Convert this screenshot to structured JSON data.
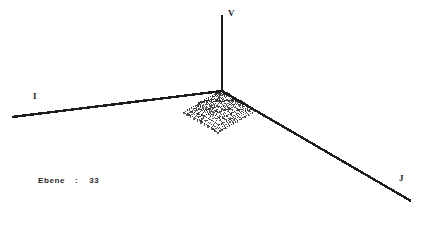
{
  "window": {
    "title": "3D Wireframe Surface Plot",
    "background_color": "#ffffff",
    "ink_color": "#2b2b2b"
  },
  "status": {
    "label": "Ebene",
    "separator": ":",
    "value": "33"
  },
  "axes": {
    "i": {
      "name": "i-axis",
      "label": "I",
      "from": [
        12,
        117
      ],
      "to": [
        222,
        91
      ]
    },
    "v": {
      "name": "v-axis",
      "label": "V",
      "from": [
        222,
        91
      ],
      "to": [
        222,
        15
      ]
    },
    "j": {
      "name": "j-axis",
      "label": "J",
      "from": [
        222,
        91
      ],
      "to": [
        411,
        201
      ]
    }
  },
  "chart_data": {
    "type": "line",
    "title": "Ebene : 33",
    "subtitle": "",
    "xlabel": "I",
    "ylabel": "J",
    "zlabel": "V",
    "render_style": "dotted-wireframe-mesh",
    "grid": false,
    "legend": null,
    "projection": {
      "origin": [
        222,
        91
      ],
      "i_axis_vector": [
        -3.82,
        2.18
      ],
      "j_axis_vector": [
        3.44,
        2.0
      ],
      "v_axis_vector": [
        0,
        -2.6
      ],
      "grid_rows": 11,
      "grid_cols": 11
    },
    "axis_ranges": {
      "i": [
        0,
        10
      ],
      "j": [
        0,
        10
      ],
      "v": [
        0,
        10
      ]
    },
    "surface_note": "11x11 height field, z values in arbitrary units",
    "heights": [
      [
        0.2,
        0.3,
        0.4,
        0.3,
        0.2,
        0.3,
        0.4,
        0.3,
        0.2,
        0.3,
        0.2
      ],
      [
        0.3,
        0.6,
        1.1,
        0.9,
        0.5,
        0.8,
        1.2,
        0.8,
        0.4,
        0.5,
        0.3
      ],
      [
        0.4,
        1.4,
        3.2,
        2.1,
        1.0,
        1.9,
        3.0,
        1.8,
        0.8,
        0.9,
        0.4
      ],
      [
        0.5,
        1.2,
        2.4,
        3.6,
        2.0,
        2.8,
        2.2,
        2.6,
        1.4,
        0.8,
        0.5
      ],
      [
        0.4,
        0.9,
        1.6,
        2.2,
        3.9,
        3.2,
        1.9,
        2.0,
        1.7,
        0.9,
        0.4
      ],
      [
        0.3,
        1.1,
        2.0,
        2.6,
        3.1,
        4.2,
        3.0,
        2.4,
        1.5,
        1.0,
        0.4
      ],
      [
        0.4,
        1.3,
        2.8,
        2.2,
        2.4,
        3.0,
        3.8,
        2.9,
        1.8,
        0.9,
        0.4
      ],
      [
        0.3,
        0.9,
        1.7,
        2.9,
        2.0,
        2.5,
        2.8,
        3.4,
        2.2,
        1.1,
        0.4
      ],
      [
        0.3,
        0.7,
        1.1,
        1.8,
        2.6,
        2.0,
        2.3,
        2.6,
        2.8,
        1.3,
        0.4
      ],
      [
        0.2,
        0.5,
        0.8,
        1.0,
        1.4,
        1.9,
        1.5,
        1.6,
        1.7,
        1.1,
        0.3
      ],
      [
        0.2,
        0.3,
        0.4,
        0.5,
        0.6,
        0.7,
        0.6,
        0.5,
        0.4,
        0.3,
        0.2
      ]
    ],
    "base_plane": {
      "visible": true,
      "style": "scatter-dots",
      "rows": 11,
      "cols": 11,
      "note": "projected base grid nodes drawn as isolated dots"
    }
  }
}
